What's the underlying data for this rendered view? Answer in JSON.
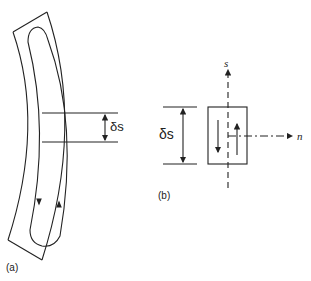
{
  "figure": {
    "panel_a": {
      "label": "(a)",
      "dimension_label": "δs",
      "description": "Curved thin-walled strip with closed-loop shear flow, cut by two sections separated by δs"
    },
    "panel_b": {
      "label": "(b)",
      "dimension_label": "δs",
      "axis_s_label": "s",
      "axis_n_label": "n",
      "description": "Element of length δs with opposing shear flow arrows and s–n axes"
    }
  },
  "colors": {
    "line": "#222222",
    "background": "#ffffff"
  }
}
